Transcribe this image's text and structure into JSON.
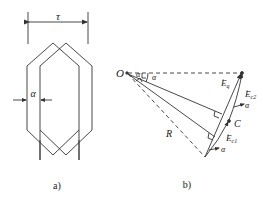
{
  "figure_a": {
    "pitch_label": "τ",
    "offset_label": "α",
    "caption": "a)"
  },
  "figure_b": {
    "origin_label": "O",
    "angle_label_1": "α",
    "angle_label_2": "α",
    "angle_label_3": "α",
    "radius_label": "R",
    "center_label": "C",
    "emf_q_main": "E",
    "emf_q_sub": "q",
    "emf_c2_main": "E",
    "emf_c2_sub": "c2",
    "emf_c1_main": "E",
    "emf_c1_sub": "c1",
    "caption": "b)"
  },
  "colors": {
    "stroke": "#333333",
    "text": "#222222",
    "background": "#ffffff"
  }
}
